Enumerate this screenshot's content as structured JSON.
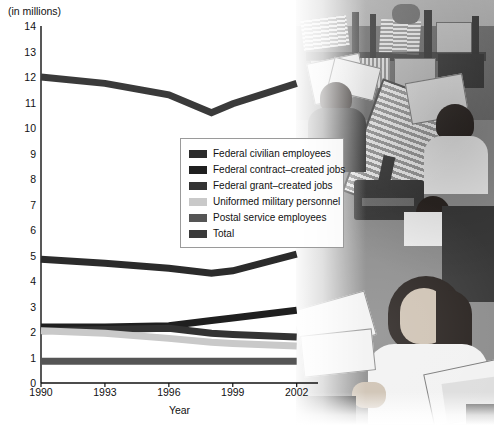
{
  "chart_data": {
    "type": "line",
    "title": "",
    "subtitle": "",
    "unit_label": "(in millions)",
    "xlabel": "Year",
    "ylabel": "",
    "x": [
      1990,
      1993,
      1996,
      1998,
      1999,
      2002
    ],
    "xticks": [
      "1990",
      "1993",
      "1996",
      "1999",
      "2002"
    ],
    "xtick_values": [
      1990,
      1993,
      1996,
      1999,
      2002
    ],
    "yticks": [
      "0",
      "1",
      "2",
      "3",
      "4",
      "5",
      "6",
      "7",
      "8",
      "9",
      "10",
      "11",
      "12",
      "13",
      "14"
    ],
    "ylim": [
      0,
      14
    ],
    "xlim": [
      1990,
      2003
    ],
    "grid": false,
    "legend_position": "center",
    "series": [
      {
        "name": "Federal civilian employees",
        "color": "#2b2b2b",
        "values": [
          4.85,
          4.7,
          4.5,
          4.3,
          4.4,
          5.05
        ]
      },
      {
        "name": "Federal contract-created jobs",
        "color": "#1f1f1f",
        "values": [
          2.2,
          2.2,
          2.25,
          2.45,
          2.55,
          2.85
        ]
      },
      {
        "name": "Federal grant-created jobs",
        "color": "#333333",
        "values": [
          2.05,
          2.1,
          2.15,
          1.95,
          1.9,
          1.8
        ]
      },
      {
        "name": "Uniformed military personnel",
        "color": "#c9c9c9",
        "values": [
          2.05,
          1.95,
          1.75,
          1.6,
          1.55,
          1.45
        ]
      },
      {
        "name": "Postal service employees",
        "color": "#555555",
        "values": [
          0.85,
          0.85,
          0.85,
          0.85,
          0.85,
          0.85
        ]
      },
      {
        "name": "Total",
        "color": "#3a3a3a",
        "values": [
          12.0,
          11.75,
          11.3,
          10.6,
          10.95,
          11.75
        ]
      }
    ]
  },
  "legend": {
    "items": [
      {
        "label": "Federal civilian employees",
        "color": "#2b2b2b"
      },
      {
        "label": "Federal contract–created jobs",
        "color": "#1f1f1f"
      },
      {
        "label": "Federal grant–created jobs",
        "color": "#333333"
      },
      {
        "label": "Uniformed military personnel",
        "color": "#c9c9c9"
      },
      {
        "label": "Postal service employees",
        "color": "#555555"
      },
      {
        "label": "Total",
        "color": "#3a3a3a"
      }
    ]
  },
  "photo": {
    "alt_name": "mail-sorting-facility-photo"
  }
}
